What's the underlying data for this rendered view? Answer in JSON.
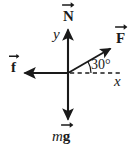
{
  "figure": {
    "type": "free-body-diagram",
    "title": "",
    "background_color": "#ffffff",
    "stroke_color": "#1a1a1a",
    "width": 135,
    "height": 153,
    "origin": {
      "x": 68,
      "y": 73
    }
  },
  "axes": {
    "y_label": "y",
    "x_label": "x",
    "y_axis": {
      "from": {
        "x": 68,
        "y": 122
      },
      "to": {
        "x": 68,
        "y": 27
      }
    },
    "x_axis_dashed": {
      "from": {
        "x": 68,
        "y": 73
      },
      "to": {
        "x": 122,
        "y": 73
      },
      "style": "dashed"
    }
  },
  "angle": {
    "label": "30°",
    "value": 30,
    "unit": "degrees",
    "between": [
      "x-axis",
      "F"
    ]
  },
  "vectors": [
    {
      "id": "N",
      "label": "N",
      "notation": "vector-arrow-overhead",
      "direction": "up",
      "angle_deg": 90,
      "tip": {
        "x": 68,
        "y": 27
      },
      "tail": {
        "x": 68,
        "y": 73
      }
    },
    {
      "id": "F",
      "label": "F",
      "notation": "vector-arrow-overhead",
      "direction": "up-right",
      "angle_deg": 30,
      "tip": {
        "x": 113,
        "y": 47
      },
      "tail": {
        "x": 68,
        "y": 73
      }
    },
    {
      "id": "f",
      "label": "f",
      "notation": "vector-arrow-overhead",
      "direction": "left",
      "angle_deg": 180,
      "tip": {
        "x": 22,
        "y": 73
      },
      "tail": {
        "x": 68,
        "y": 73
      }
    },
    {
      "id": "mg",
      "label_scalar": "m",
      "label": "g",
      "notation": "vector-arrow-overhead",
      "direction": "down",
      "angle_deg": 270,
      "tip": {
        "x": 68,
        "y": 122
      },
      "tail": {
        "x": 68,
        "y": 73
      }
    }
  ]
}
